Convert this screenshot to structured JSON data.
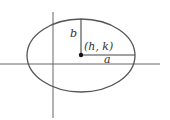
{
  "diagram": {
    "type": "ellipse-with-axes",
    "colors": {
      "stroke": "#555555",
      "text": "#333333",
      "background": "#ffffff"
    },
    "labels": {
      "semi_minor": "b",
      "center": "(h, k)",
      "semi_major": "a"
    }
  }
}
